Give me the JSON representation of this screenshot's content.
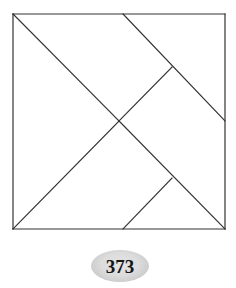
{
  "figure": {
    "kind": "tangram-dissection-diagram",
    "caption_number": "373",
    "background_color": "#ffffff",
    "stroke_color": "#333333",
    "stroke_width": 1.2,
    "badge": {
      "shape": "ellipse",
      "fill_color": "#d8d8d8",
      "text": "373",
      "text_color": "#161616"
    },
    "square": {
      "left": 13,
      "top": 14,
      "right": 225,
      "bottom": 229,
      "label": "outer-square"
    },
    "vertices": {
      "top_left": [
        13,
        14
      ],
      "top_mid": [
        123,
        14
      ],
      "top_right": [
        225,
        14
      ],
      "right_mid": [
        225,
        121
      ],
      "bottom_right": [
        225,
        229
      ],
      "bottom_mid": [
        123,
        229
      ],
      "bottom_left": [
        13,
        229
      ],
      "center": [
        119,
        121
      ],
      "upper_t_junction": [
        172,
        67
      ],
      "lower_t_junction": [
        172,
        178
      ]
    },
    "segments": [
      {
        "name": "square-top-edge",
        "from": [
          13,
          14
        ],
        "to": [
          225,
          14
        ]
      },
      {
        "name": "square-right-edge",
        "from": [
          225,
          14
        ],
        "to": [
          225,
          229
        ]
      },
      {
        "name": "square-bottom-edge",
        "from": [
          225,
          229
        ],
        "to": [
          13,
          229
        ]
      },
      {
        "name": "square-left-edge",
        "from": [
          13,
          229
        ],
        "to": [
          13,
          14
        ]
      },
      {
        "name": "main-diagonal-topleft-to-center",
        "from": [
          13,
          14
        ],
        "to": [
          119,
          121
        ]
      },
      {
        "name": "main-diagonal-center-to-bottomright",
        "from": [
          119,
          121
        ],
        "to": [
          225,
          229
        ]
      },
      {
        "name": "anti-diagonal-topmid-to-rightmid",
        "from": [
          123,
          14
        ],
        "to": [
          225,
          121
        ]
      },
      {
        "name": "anti-diagonal-center-to-bottomleft",
        "from": [
          119,
          121
        ],
        "to": [
          13,
          229
        ]
      },
      {
        "name": "upper-branch-to-center",
        "from": [
          172,
          67
        ],
        "to": [
          119,
          121
        ]
      },
      {
        "name": "lower-branch-to-bottommid",
        "from": [
          172,
          178
        ],
        "to": [
          123,
          229
        ]
      }
    ]
  }
}
